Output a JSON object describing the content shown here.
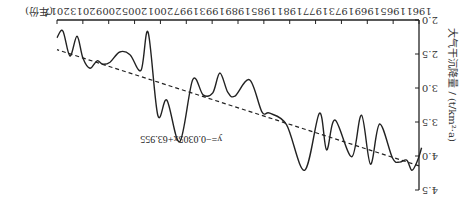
{
  "chart_data": {
    "type": "line",
    "orientation": "rotated-180",
    "title": "",
    "xlabel": "年份",
    "ylabel": "大气干沉降量 / (t/km²·a)",
    "xlim": [
      1961,
      2017
    ],
    "ylim": [
      2.0,
      4.5
    ],
    "x_ticks": [
      1961,
      1965,
      1969,
      1973,
      1977,
      1981,
      1985,
      1989,
      1993,
      1997,
      2001,
      2005,
      2009,
      2013,
      2017
    ],
    "y_ticks": [
      "2.0",
      "2.5",
      "3.0",
      "3.5",
      "4.0",
      "4.5"
    ],
    "grid": false,
    "series": [
      {
        "name": "大气干沉降量",
        "style": "solid-smooth",
        "color": "#222222",
        "x": [
          1960.6,
          1961.2,
          1962.1,
          1962.9,
          1964.0,
          1965.1,
          1967.1,
          1968.5,
          1969.9,
          1971.4,
          1974.0,
          1975.3,
          1976.4,
          1978.7,
          1981.5,
          1984.1,
          1985.3,
          1987.2,
          1989.5,
          1990.6,
          1991.8,
          1992.9,
          1994.4,
          1996.0,
          1998.0,
          2000.0,
          2001.4,
          2002.9,
          2004.0,
          2005.7,
          2007.3,
          2008.8,
          2009.9,
          2010.8,
          2011.9,
          2013.0,
          2013.9,
          2015.0,
          2016.1,
          2017.0
        ],
        "values": [
          3.88,
          4.06,
          4.21,
          4.06,
          4.09,
          4.03,
          3.53,
          4.12,
          3.4,
          4.01,
          3.47,
          3.91,
          3.37,
          4.21,
          3.54,
          3.37,
          3.35,
          2.88,
          3.12,
          3.06,
          2.78,
          3.07,
          3.1,
          2.88,
          3.79,
          3.18,
          3.4,
          2.18,
          2.74,
          2.51,
          2.47,
          2.62,
          2.65,
          2.6,
          2.71,
          2.56,
          2.24,
          2.53,
          2.16,
          2.26
        ]
      },
      {
        "name": "线性趋势",
        "style": "dashed",
        "color": "#222222",
        "equation": "y=−0.0305x+63.955",
        "slope": -0.0305,
        "intercept": 63.955
      }
    ],
    "annotations": [
      {
        "text": "y=−0.0305x+63.955",
        "near_year": 1993,
        "near_value": 3.7
      }
    ]
  }
}
